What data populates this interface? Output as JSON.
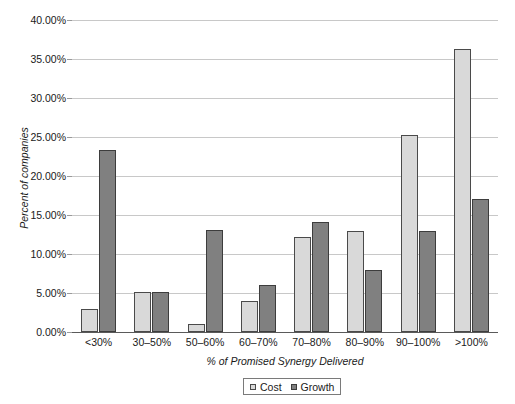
{
  "chart_data": {
    "type": "bar",
    "title": "",
    "xlabel": "% of Promised Synergy Delivered",
    "ylabel": "Percent of companies",
    "categories": [
      "<30%",
      "30–50%",
      "50–60%",
      "60–70%",
      "70–80%",
      "80–90%",
      "90–100%",
      ">100%"
    ],
    "series": [
      {
        "name": "Cost",
        "color": "#d9d9d9",
        "values": [
          3.0,
          5.1,
          1.0,
          4.0,
          12.2,
          13.0,
          25.2,
          36.3
        ]
      },
      {
        "name": "Growth",
        "color": "#808080",
        "values": [
          23.3,
          5.1,
          13.1,
          6.0,
          14.1,
          8.0,
          13.0,
          17.1
        ]
      }
    ],
    "ylim": [
      0,
      40
    ],
    "ytick_values": [
      0,
      5,
      10,
      15,
      20,
      25,
      30,
      35,
      40
    ],
    "ytick_labels": [
      "0.00%",
      "5.00%",
      "10.00%",
      "15.00%",
      "20.00%",
      "25.00%",
      "30.00%",
      "35.00%",
      "40.00%"
    ],
    "grid": true,
    "legend_position": "bottom-center"
  },
  "legend": {
    "items": [
      {
        "label": "Cost",
        "swatch": "cost"
      },
      {
        "label": "Growth",
        "swatch": "growth"
      }
    ]
  }
}
